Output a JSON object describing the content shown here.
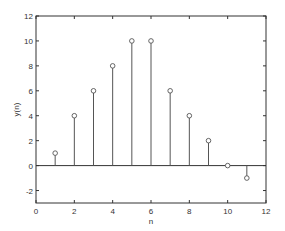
{
  "chart_data": {
    "type": "stem",
    "title": "",
    "xlabel": "n",
    "ylabel": "y(n)",
    "x": [
      1,
      2,
      3,
      4,
      5,
      6,
      7,
      8,
      9,
      10,
      11
    ],
    "values": [
      1,
      4,
      6,
      8,
      10,
      10,
      6,
      4,
      2,
      0,
      -1
    ],
    "xlim": [
      0,
      12
    ],
    "ylim": [
      -3,
      12
    ],
    "xticks": [
      0,
      2,
      4,
      6,
      8,
      10,
      12
    ],
    "yticks": [
      -2,
      0,
      2,
      4,
      6,
      8,
      10,
      12
    ],
    "grid": false,
    "legend": null,
    "baseline": 0,
    "colors": {
      "stem": "#555555",
      "marker": "#555555",
      "axes": "#333333"
    }
  }
}
